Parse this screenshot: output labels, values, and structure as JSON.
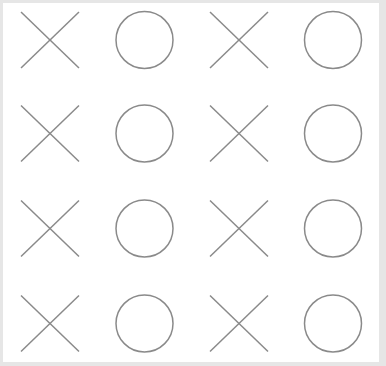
{
  "board": {
    "rows": 4,
    "cols": 4,
    "cells": [
      [
        "X",
        "O",
        "X",
        "O"
      ],
      [
        "X",
        "O",
        "X",
        "O"
      ],
      [
        "X",
        "O",
        "X",
        "O"
      ],
      [
        "X",
        "O",
        "X",
        "O"
      ]
    ],
    "col_centers": [
      50,
      144.5,
      239,
      333
    ],
    "row_centers": [
      40,
      133.5,
      228.5,
      323.5
    ],
    "mark_half_width": 29,
    "mark_half_height": 28,
    "circle_radius": 28.5
  },
  "colors": {
    "background": "#e6e6e6",
    "panel": "#ffffff",
    "stroke": "#8a8a8a"
  },
  "icons": {
    "X": "cross-icon",
    "O": "circle-icon"
  }
}
